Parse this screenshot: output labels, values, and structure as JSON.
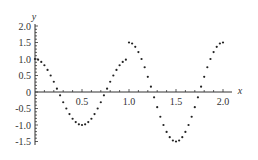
{
  "chart_data": {
    "type": "scatter",
    "title": "",
    "xlabel": "x",
    "ylabel": "y",
    "xlim": [
      0,
      2.0
    ],
    "ylim": [
      -1.5,
      2.0
    ],
    "grid": false,
    "legend": null,
    "x_ticks": [
      "0.5",
      "1.0",
      "1.5",
      "2.0"
    ],
    "x_tick_values": [
      0.5,
      1.0,
      1.5,
      2.0
    ],
    "y_ticks": [
      "-1.5",
      "-1.0",
      "-0.5",
      "0",
      "0.5",
      "1.0",
      "1.5",
      "2.0"
    ],
    "y_tick_values": [
      -1.5,
      -1.0,
      -0.5,
      0,
      0.5,
      1.0,
      1.5,
      2.0
    ],
    "series": [
      {
        "name": "segment-1 (y = cos 2πx, 0 ≤ x < 1)",
        "amplitude": 1.0,
        "x_start": 0.0,
        "x_end": 0.9667,
        "step": 0.0333,
        "x": [
          0,
          0.0333,
          0.0667,
          0.1,
          0.1333,
          0.1667,
          0.2,
          0.2333,
          0.2667,
          0.3,
          0.3333,
          0.3667,
          0.4,
          0.4333,
          0.4667,
          0.5,
          0.5333,
          0.5667,
          0.6,
          0.6333,
          0.6667,
          0.7,
          0.7333,
          0.7667,
          0.8,
          0.8333,
          0.8667,
          0.9,
          0.9333,
          0.9667
        ],
        "values": [
          1.0,
          0.98,
          0.91,
          0.81,
          0.67,
          0.5,
          0.31,
          0.1,
          -0.1,
          -0.31,
          -0.5,
          -0.67,
          -0.81,
          -0.91,
          -0.98,
          -1.0,
          -0.98,
          -0.91,
          -0.81,
          -0.67,
          -0.5,
          -0.31,
          -0.1,
          0.1,
          0.31,
          0.5,
          0.67,
          0.81,
          0.91,
          0.98
        ]
      },
      {
        "name": "segment-2 (y = 1.5 cos 2πx, 1 ≤ x ≤ 2)",
        "amplitude": 1.5,
        "x_start": 1.0,
        "x_end": 2.0,
        "step": 0.0333,
        "x": [
          1.0,
          1.0333,
          1.0667,
          1.1,
          1.1333,
          1.1667,
          1.2,
          1.2333,
          1.2667,
          1.3,
          1.3333,
          1.3667,
          1.4,
          1.4333,
          1.4667,
          1.5,
          1.5333,
          1.5667,
          1.6,
          1.6333,
          1.6667,
          1.7,
          1.7333,
          1.7667,
          1.8,
          1.8333,
          1.8667,
          1.9,
          1.9333,
          1.9667,
          2.0
        ],
        "values": [
          1.5,
          1.47,
          1.37,
          1.21,
          1.0,
          0.75,
          0.46,
          0.16,
          -0.16,
          -0.46,
          -0.75,
          -1.0,
          -1.21,
          -1.37,
          -1.47,
          -1.5,
          -1.47,
          -1.37,
          -1.21,
          -1.0,
          -0.75,
          -0.46,
          -0.16,
          0.16,
          0.46,
          0.75,
          1.0,
          1.21,
          1.37,
          1.47,
          1.5
        ]
      }
    ]
  },
  "colors": {
    "axis": "#333333",
    "dots": "#222222",
    "background": "#ffffff"
  }
}
